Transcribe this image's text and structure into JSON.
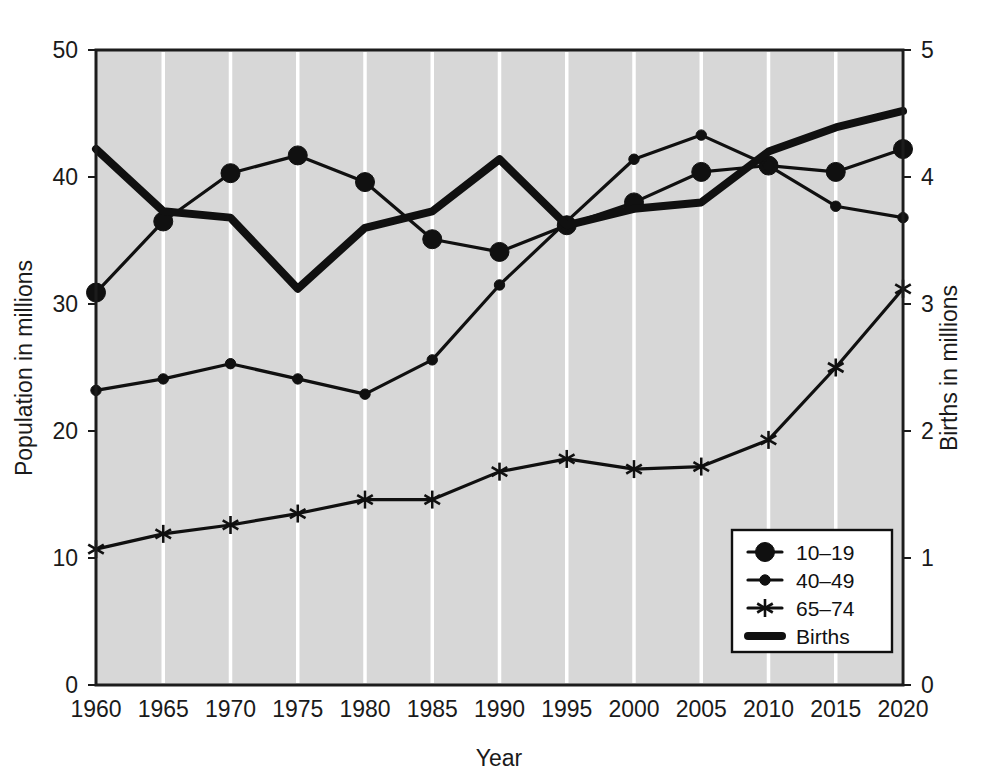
{
  "chart_data": {
    "type": "line",
    "title": "",
    "xlabel": "Year",
    "ylabel": "Population in millions",
    "y2label": "Births in millions",
    "grid": true,
    "legend_position": "bottom-right",
    "x": [
      1960,
      1965,
      1970,
      1975,
      1980,
      1985,
      1990,
      1995,
      2000,
      2005,
      2010,
      2015,
      2020
    ],
    "categories": [
      "1960",
      "1965",
      "1970",
      "1975",
      "1980",
      "1985",
      "1990",
      "1995",
      "2000",
      "2005",
      "2010",
      "2015",
      "2020"
    ],
    "xlim": [
      1960,
      2020
    ],
    "ylim": [
      0,
      50
    ],
    "y2lim": [
      0,
      5
    ],
    "yticks": [
      0,
      10,
      20,
      30,
      40,
      50
    ],
    "ytick_labels": [
      "0",
      "10",
      "20",
      "30",
      "40",
      "50"
    ],
    "y2ticks": [
      0,
      1,
      2,
      3,
      4,
      5
    ],
    "y2tick_labels": [
      "0",
      "1",
      "2",
      "3",
      "4",
      "5"
    ],
    "series": [
      {
        "name": "10–19",
        "axis": "left",
        "marker": "large-filled-circle",
        "line_width": "thin",
        "values": [
          30.9,
          36.5,
          40.3,
          41.7,
          39.6,
          35.1,
          34.1,
          36.2,
          38.0,
          40.4,
          40.9,
          40.4,
          42.2
        ]
      },
      {
        "name": "40–49",
        "axis": "left",
        "marker": "small-filled-circle",
        "line_width": "thin",
        "values": [
          23.2,
          24.1,
          25.3,
          24.1,
          22.9,
          25.6,
          31.5,
          36.5,
          41.4,
          43.3,
          40.9,
          37.7,
          36.8
        ]
      },
      {
        "name": "65–74",
        "axis": "left",
        "marker": "asterisk",
        "line_width": "thin",
        "values": [
          10.7,
          11.9,
          12.6,
          13.5,
          14.6,
          14.6,
          16.8,
          17.8,
          17.0,
          17.2,
          19.3,
          25.0,
          31.2
        ]
      },
      {
        "name": "Births",
        "axis": "right",
        "marker": "none",
        "line_width": "thick",
        "values": [
          4.22,
          3.73,
          3.68,
          3.12,
          3.6,
          3.73,
          4.14,
          3.62,
          3.75,
          3.8,
          4.2,
          4.39,
          4.52
        ]
      }
    ]
  },
  "axes": {
    "left_title": "Population in millions",
    "right_title": "Births in millions",
    "bottom_title": "Year",
    "left_ticks": [
      "50",
      "40",
      "30",
      "20",
      "10",
      "0"
    ],
    "right_ticks": [
      "5",
      "4",
      "3",
      "2",
      "1",
      "0"
    ],
    "x_ticks": [
      "1960",
      "1965",
      "1970",
      "1975",
      "1980",
      "1985",
      "1990",
      "1995",
      "2000",
      "2005",
      "2010",
      "2015",
      "2020"
    ]
  },
  "legend": {
    "items": [
      {
        "label": "10–19",
        "marker": "large-filled-circle"
      },
      {
        "label": "40–49",
        "marker": "small-filled-circle"
      },
      {
        "label": "65–74",
        "marker": "asterisk"
      },
      {
        "label": "Births",
        "marker": "thick-line"
      }
    ]
  },
  "colors": {
    "plot_background": "#d7d7d7",
    "gridline": "#ffffff",
    "ink": "#101010",
    "page_background": "#ffffff"
  }
}
